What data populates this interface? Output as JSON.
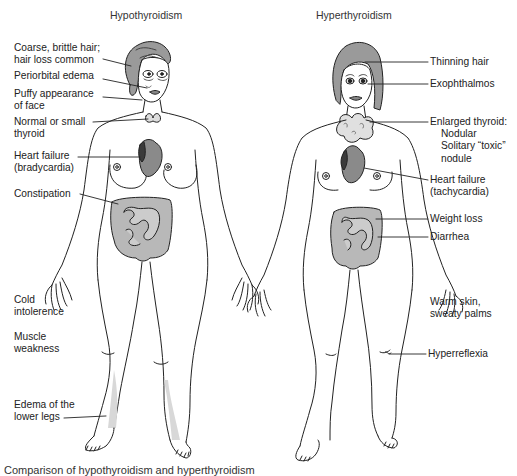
{
  "panels": [
    {
      "title": "Hypothyroidism",
      "labels": {
        "hair": [
          "Coarse, brittle hair;",
          "hair loss common"
        ],
        "eyes": [
          "Periorbital edema"
        ],
        "face": [
          "Puffy appearance",
          "of face"
        ],
        "thyroid": [
          "Normal or small",
          "thyroid"
        ],
        "heart": [
          "Heart failure",
          "(bradycardia)"
        ],
        "gi": [
          "Constipation"
        ],
        "temp": [
          "Cold",
          "intolerence"
        ],
        "muscle": [
          "Muscle",
          "weakness"
        ],
        "legs": [
          "Edema of the",
          "lower legs"
        ]
      }
    },
    {
      "title": "Hyperthyroidism",
      "labels": {
        "hair": [
          "Thinning hair"
        ],
        "eyes": [
          "Exophthalmos"
        ],
        "thyroid": [
          "Enlarged thyroid:",
          "Nodular",
          "Solitary “toxic”",
          "nodule"
        ],
        "heart": [
          "Heart failure",
          "(tachycardia)"
        ],
        "weight": [
          "Weight loss"
        ],
        "gi": [
          "Diarrhea"
        ],
        "skin": [
          "Warm skin,",
          "sweaty palms"
        ],
        "reflex": [
          "Hyperreflexia"
        ]
      }
    }
  ],
  "caption": "Comparison of hypothyroidism and hyperthyroidism",
  "colors": {
    "line": "#222222",
    "organ_fill": "#b8b8b8",
    "heart_fill": "#8a8a8a",
    "heart_dark": "#3a3a3a",
    "edema_shade": "#d8d8d8",
    "hair_fill": "#9a9a9a"
  }
}
